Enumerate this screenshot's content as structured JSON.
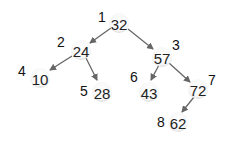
{
  "diagram": {
    "type": "binary-tree",
    "colors": {
      "edge": "#666666",
      "node_fill": "#f4f4f4",
      "text": "#222222"
    },
    "nodes": [
      {
        "id": 1,
        "value": "32",
        "index_label": "1",
        "cx": 119,
        "cy": 23,
        "lx": 102,
        "ly": 17
      },
      {
        "id": 2,
        "value": "24",
        "index_label": "2",
        "cx": 81,
        "cy": 50,
        "lx": 61,
        "ly": 42
      },
      {
        "id": 3,
        "value": "57",
        "index_label": "3",
        "cx": 162,
        "cy": 57,
        "lx": 176,
        "ly": 45
      },
      {
        "id": 4,
        "value": "10",
        "index_label": "4",
        "cx": 40,
        "cy": 78,
        "lx": 22,
        "ly": 71
      },
      {
        "id": 5,
        "value": "28",
        "index_label": "5",
        "cx": 102,
        "cy": 92,
        "lx": 84,
        "ly": 91
      },
      {
        "id": 6,
        "value": "43",
        "index_label": "6",
        "cx": 149,
        "cy": 92,
        "lx": 134,
        "ly": 77
      },
      {
        "id": 7,
        "value": "72",
        "index_label": "7",
        "cx": 198,
        "cy": 89,
        "lx": 212,
        "ly": 80
      },
      {
        "id": 8,
        "value": "62",
        "index_label": "8",
        "cx": 178,
        "cy": 122,
        "lx": 161,
        "ly": 122
      }
    ],
    "edges": [
      {
        "from": 1,
        "to": 2,
        "x1": 111,
        "y1": 28,
        "x2": 90,
        "y2": 43
      },
      {
        "from": 1,
        "to": 3,
        "x1": 128,
        "y1": 29,
        "x2": 153,
        "y2": 49
      },
      {
        "from": 2,
        "to": 4,
        "x1": 72,
        "y1": 56,
        "x2": 50,
        "y2": 70
      },
      {
        "from": 2,
        "to": 5,
        "x1": 86,
        "y1": 58,
        "x2": 97,
        "y2": 80
      },
      {
        "from": 3,
        "to": 6,
        "x1": 159,
        "y1": 65,
        "x2": 151,
        "y2": 80
      },
      {
        "from": 3,
        "to": 7,
        "x1": 169,
        "y1": 63,
        "x2": 190,
        "y2": 82
      },
      {
        "from": 7,
        "to": 8,
        "x1": 194,
        "y1": 97,
        "x2": 182,
        "y2": 112
      }
    ]
  }
}
